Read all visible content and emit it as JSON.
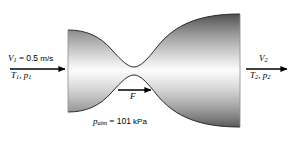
{
  "figure": {
    "background_color": "#ffffff",
    "body_color_edge": "#4a4a4a",
    "body_color_center": "#fbfbfb",
    "outline_color": "#2b2b2b",
    "arrow_color": "#000000"
  },
  "inlet": {
    "velocity_symbol": "V",
    "velocity_subscript": "1",
    "equals": " = ",
    "velocity_value": "0.5",
    "velocity_unit": "m/s",
    "temperature_symbol": "T",
    "temperature_subscript": "1",
    "comma": ", ",
    "pressure_symbol": "p",
    "pressure_subscript": "1",
    "arrow_name": "inlet-flow-arrow"
  },
  "outlet": {
    "velocity_symbol": "V",
    "velocity_subscript": "2",
    "temperature_symbol": "T",
    "temperature_subscript": "2",
    "comma": ", ",
    "pressure_symbol": "p",
    "pressure_subscript": "2",
    "arrow_name": "outlet-flow-arrow"
  },
  "force": {
    "symbol": "F",
    "arrow_name": "reaction-force-arrow"
  },
  "ambient": {
    "pressure_symbol": "p",
    "pressure_subscript": "atm",
    "equals": " = ",
    "value": "101",
    "unit": "kPa"
  }
}
